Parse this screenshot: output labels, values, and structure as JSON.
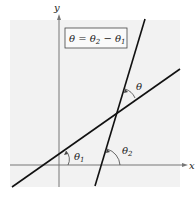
{
  "diagram": {
    "formula": "θ = θ₂ − θ₁",
    "axis_x_label": "x",
    "axis_y_label": "y",
    "angle_labels": {
      "theta": "θ",
      "theta1": "θ",
      "theta1_sub": "1",
      "theta2": "θ",
      "theta2_sub": "2"
    },
    "formula_parts": {
      "lhs": "θ",
      "eq": " = θ",
      "sub2": "2",
      "minus": " − θ",
      "sub1": "1"
    },
    "colors": {
      "panel": "#f2f2f2",
      "line": "#111111",
      "axis": "#777777"
    }
  }
}
